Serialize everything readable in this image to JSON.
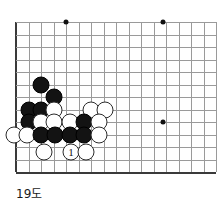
{
  "diagram": {
    "caption": "19도",
    "kind": "go-board-corner-diagram"
  },
  "board": {
    "origin_x": 16,
    "origin_y": 22,
    "spacing": 12.5,
    "cols": 16,
    "rows": 12,
    "line_color": "#9a9a9a",
    "edge_color": "#3a3a3a",
    "background": "#ffffff",
    "star_points": [
      {
        "col": 4,
        "row": 0
      },
      {
        "col": 11.75,
        "row": 0
      },
      {
        "col": 11.75,
        "row": 8
      }
    ],
    "stone_colors": {
      "black": "#131313",
      "white": "#ffffff",
      "outline": "#2b2b2b"
    }
  },
  "stones": [
    {
      "col": 2,
      "row": 5,
      "color": "black",
      "label": ""
    },
    {
      "col": 3,
      "row": 6,
      "color": "black",
      "label": ""
    },
    {
      "col": 1,
      "row": 7,
      "color": "black",
      "label": ""
    },
    {
      "col": 2,
      "row": 7,
      "color": "black",
      "label": ""
    },
    {
      "col": 3,
      "row": 7,
      "color": "white",
      "label": ""
    },
    {
      "col": 6,
      "row": 7,
      "color": "white",
      "label": ""
    },
    {
      "col": 7.1,
      "row": 7,
      "color": "white",
      "label": ""
    },
    {
      "col": 1,
      "row": 8,
      "color": "black",
      "label": ""
    },
    {
      "col": 2,
      "row": 8,
      "color": "white",
      "label": ""
    },
    {
      "col": 3,
      "row": 8,
      "color": "white",
      "label": ""
    },
    {
      "col": 4.3,
      "row": 8,
      "color": "white",
      "label": ""
    },
    {
      "col": 5.4,
      "row": 8,
      "color": "black",
      "label": ""
    },
    {
      "col": 6.6,
      "row": 8,
      "color": "white",
      "label": ""
    },
    {
      "col": -0.2,
      "row": 9,
      "color": "white",
      "label": ""
    },
    {
      "col": 0.9,
      "row": 9,
      "color": "white",
      "label": ""
    },
    {
      "col": 2,
      "row": 9,
      "color": "black",
      "label": ""
    },
    {
      "col": 3.1,
      "row": 9,
      "color": "black",
      "label": ""
    },
    {
      "col": 4.3,
      "row": 9,
      "color": "black",
      "label": ""
    },
    {
      "col": 5.4,
      "row": 9,
      "color": "black",
      "label": ""
    },
    {
      "col": 6.6,
      "row": 9,
      "color": "white",
      "label": ""
    },
    {
      "col": 2.2,
      "row": 10.4,
      "color": "white",
      "label": ""
    },
    {
      "col": 4.4,
      "row": 10.4,
      "color": "white",
      "label": "1"
    },
    {
      "col": 5.6,
      "row": 10.4,
      "color": "white",
      "label": ""
    }
  ]
}
